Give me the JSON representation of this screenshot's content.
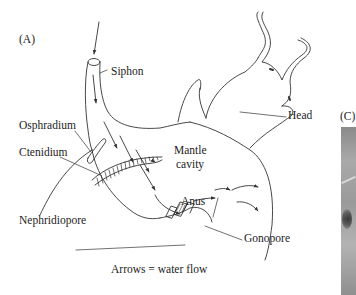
{
  "figure": {
    "panel_a_label": "(A)",
    "panel_c_label": "(C)",
    "labels": {
      "siphon": "Siphon",
      "osphradium": "Osphradium",
      "ctenidium": "Ctenidium",
      "mantle_cavity_line1": "Mantle",
      "mantle_cavity_line2": "cavity",
      "head": "Head",
      "anus": "Anus",
      "nephridiopore": "Nephridiopore",
      "gonopore": "Gonopore"
    },
    "caption": "Arrows = water flow",
    "colors": {
      "line": "#333333",
      "text": "#222222",
      "background": "#ffffff"
    }
  }
}
